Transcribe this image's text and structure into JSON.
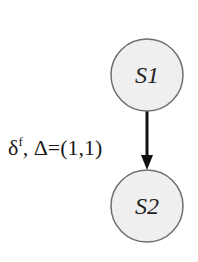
{
  "diagram": {
    "type": "state-transition",
    "background": "#ffffff",
    "node_fill": "#efefef",
    "node_stroke": "#6e6e6e",
    "edge_color": "#111111",
    "nodes": [
      {
        "id": "S1",
        "label": "S1",
        "cx": 147,
        "cy": 75,
        "r": 36
      },
      {
        "id": "S2",
        "label": "S2",
        "cx": 147,
        "cy": 206,
        "r": 36
      }
    ],
    "edges": [
      {
        "from": "S1",
        "to": "S2",
        "label_symbol": "δ",
        "label_superscript": "f",
        "label_rest": ", Δ=(1,1)",
        "directed": true
      }
    ]
  }
}
